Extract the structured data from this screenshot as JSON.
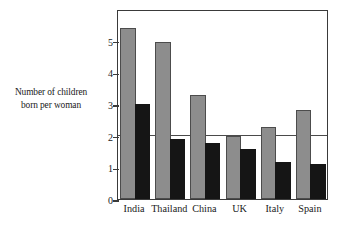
{
  "chart_data": {
    "type": "bar",
    "title": "",
    "xlabel": "",
    "ylabel": "Number of children born per woman",
    "ylabel_lines": [
      "Number of children",
      "born per woman"
    ],
    "categories": [
      "India",
      "Thailand",
      "China",
      "UK",
      "Italy",
      "Spain"
    ],
    "series": [
      {
        "name": "earlier",
        "color": "#8d8d8d",
        "values": [
          5.4,
          4.95,
          3.3,
          2.0,
          2.27,
          2.82
        ]
      },
      {
        "name": "later",
        "color": "#151515",
        "values": [
          3.0,
          1.9,
          1.77,
          1.57,
          1.17,
          1.1
        ]
      }
    ],
    "ylim": [
      0,
      6
    ],
    "yticks": [
      0,
      1,
      2,
      3,
      4,
      5
    ],
    "yticklabels": [
      "0",
      "1",
      "2",
      "3",
      "4",
      "5"
    ],
    "reference_line": 2.08,
    "grid": false,
    "legend": "none"
  },
  "axis": {
    "tick_values": [
      0,
      1,
      2,
      3,
      4,
      5
    ],
    "tick_labels": [
      "0",
      "1",
      "2",
      "3",
      "4",
      "5"
    ]
  },
  "colors": {
    "gray_bar": "#8d8d8d",
    "black_bar": "#151515",
    "frame": "#3a3a3a",
    "reference_line": "#4a4a4a",
    "background": "#ffffff"
  }
}
